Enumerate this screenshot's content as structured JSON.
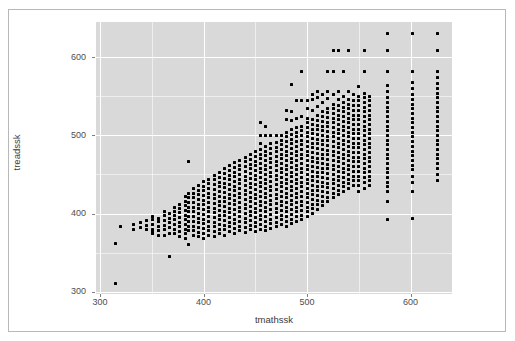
{
  "figure": {
    "kind": "scatterplot",
    "background": "#ffffff",
    "panel_background": "#d9d9d9",
    "grid_color": "#ffffff",
    "point_color": "#000000",
    "axis_text_color": "#4d4d4d",
    "border_color": "#b8b8b8"
  },
  "chart_data": {
    "type": "scatter",
    "title": "",
    "xlabel": "tmathssk",
    "ylabel": "treadssk",
    "xlim": [
      296,
      640
    ],
    "ylim": [
      297,
      645
    ],
    "x_ticks": [
      300,
      400,
      500,
      600
    ],
    "y_ticks": [
      300,
      400,
      500,
      600
    ],
    "x_tick_labels": [
      "300",
      "400",
      "500",
      "600"
    ],
    "y_tick_labels": [
      "300",
      "400",
      "500",
      "600"
    ],
    "grid": "major and minor white gridlines",
    "legend": "none",
    "n_points_approx": 5700,
    "relationship": "strong positive association; discrete scaled-score columns",
    "columns": [
      {
        "x": 315,
        "y": [
          311,
          362
        ]
      },
      {
        "x": 320,
        "y": [
          384
        ]
      },
      {
        "x": 332,
        "y": [
          380,
          386
        ]
      },
      {
        "x": 339,
        "y": [
          382,
          388
        ]
      },
      {
        "x": 345,
        "y": [
          379,
          385,
          391
        ]
      },
      {
        "x": 351,
        "y": [
          374,
          377,
          380,
          386,
          392,
          396
        ]
      },
      {
        "x": 356,
        "y": [
          372,
          378,
          384,
          390,
          394
        ]
      },
      {
        "x": 362,
        "y": [
          372,
          379,
          385,
          391,
          397,
          402
        ]
      },
      {
        "x": 367,
        "y": [
          345,
          375,
          382,
          388,
          394,
          400
        ]
      },
      {
        "x": 372,
        "y": [
          374,
          380,
          386,
          392,
          398,
          403,
          408
        ]
      },
      {
        "x": 377,
        "y": [
          371,
          377,
          383,
          389,
          395,
          401,
          406,
          412
        ]
      },
      {
        "x": 382,
        "y": [
          368,
          374,
          380,
          386,
          392,
          398,
          404,
          410,
          416,
          422
        ]
      },
      {
        "x": 385,
        "y": [
          360,
          378,
          384,
          390,
          396,
          402,
          408,
          414,
          420,
          426,
          467
        ]
      },
      {
        "x": 390,
        "y": [
          372,
          378,
          384,
          390,
          396,
          402,
          408,
          414,
          420,
          426,
          432
        ]
      },
      {
        "x": 395,
        "y": [
          370,
          376,
          382,
          388,
          394,
          400,
          406,
          412,
          418,
          424,
          430,
          436
        ]
      },
      {
        "x": 400,
        "y": [
          368,
          375,
          381,
          387,
          393,
          399,
          405,
          411,
          417,
          423,
          429,
          435,
          441
        ]
      },
      {
        "x": 405,
        "y": [
          372,
          378,
          384,
          390,
          396,
          402,
          408,
          414,
          420,
          426,
          432,
          438,
          444
        ]
      },
      {
        "x": 410,
        "y": [
          370,
          377,
          383,
          389,
          395,
          401,
          407,
          413,
          419,
          425,
          431,
          437,
          443,
          449
        ]
      },
      {
        "x": 415,
        "y": [
          374,
          380,
          386,
          392,
          398,
          404,
          410,
          416,
          422,
          428,
          434,
          440,
          446,
          452
        ]
      },
      {
        "x": 420,
        "y": [
          372,
          379,
          385,
          391,
          397,
          403,
          409,
          415,
          421,
          427,
          433,
          439,
          445,
          451,
          457
        ]
      },
      {
        "x": 425,
        "y": [
          377,
          383,
          389,
          395,
          401,
          407,
          413,
          419,
          425,
          431,
          437,
          443,
          449,
          455,
          461
        ]
      },
      {
        "x": 430,
        "y": [
          375,
          381,
          387,
          393,
          399,
          405,
          411,
          417,
          423,
          429,
          435,
          441,
          447,
          453,
          459,
          465
        ]
      },
      {
        "x": 435,
        "y": [
          378,
          384,
          390,
          396,
          402,
          408,
          414,
          420,
          426,
          432,
          438,
          444,
          450,
          456,
          462,
          468
        ]
      },
      {
        "x": 440,
        "y": [
          376,
          382,
          388,
          394,
          400,
          406,
          412,
          418,
          424,
          430,
          436,
          442,
          448,
          454,
          460,
          466,
          472
        ]
      },
      {
        "x": 445,
        "y": [
          379,
          385,
          391,
          397,
          403,
          409,
          415,
          421,
          427,
          433,
          439,
          445,
          451,
          457,
          463,
          469,
          475
        ]
      },
      {
        "x": 450,
        "y": [
          377,
          383,
          389,
          395,
          401,
          407,
          413,
          419,
          425,
          431,
          437,
          443,
          449,
          455,
          461,
          467,
          473,
          479
        ]
      },
      {
        "x": 455,
        "y": [
          380,
          386,
          392,
          398,
          404,
          410,
          416,
          422,
          428,
          434,
          440,
          446,
          452,
          458,
          464,
          470,
          476,
          482,
          490,
          500,
          516
        ]
      },
      {
        "x": 460,
        "y": [
          378,
          384,
          390,
          396,
          402,
          408,
          414,
          420,
          426,
          432,
          438,
          444,
          450,
          456,
          462,
          468,
          474,
          480,
          486,
          500,
          512
        ]
      },
      {
        "x": 465,
        "y": [
          381,
          387,
          393,
          399,
          405,
          411,
          417,
          423,
          429,
          435,
          441,
          447,
          453,
          459,
          465,
          471,
          477,
          483,
          489,
          500
        ]
      },
      {
        "x": 470,
        "y": [
          383,
          389,
          395,
          401,
          407,
          413,
          419,
          425,
          431,
          437,
          443,
          449,
          455,
          461,
          467,
          473,
          479,
          485,
          491,
          500
        ]
      },
      {
        "x": 475,
        "y": [
          386,
          392,
          398,
          404,
          410,
          416,
          422,
          428,
          434,
          440,
          446,
          452,
          458,
          464,
          470,
          476,
          482,
          488,
          494,
          500
        ]
      },
      {
        "x": 480,
        "y": [
          384,
          390,
          396,
          402,
          408,
          414,
          420,
          426,
          432,
          438,
          444,
          450,
          456,
          462,
          468,
          474,
          480,
          486,
          492,
          498,
          504,
          520,
          532
        ]
      },
      {
        "x": 485,
        "y": [
          387,
          393,
          399,
          405,
          411,
          417,
          423,
          429,
          435,
          441,
          447,
          453,
          459,
          465,
          471,
          477,
          483,
          489,
          495,
          501,
          507,
          519,
          530,
          565
        ]
      },
      {
        "x": 490,
        "y": [
          390,
          396,
          402,
          408,
          414,
          420,
          426,
          432,
          438,
          444,
          450,
          456,
          462,
          468,
          474,
          480,
          486,
          492,
          498,
          504,
          510,
          522,
          545
        ]
      },
      {
        "x": 495,
        "y": [
          392,
          398,
          404,
          410,
          416,
          422,
          428,
          434,
          440,
          446,
          452,
          458,
          464,
          470,
          476,
          482,
          488,
          494,
          500,
          506,
          512,
          524,
          545,
          582
        ]
      },
      {
        "x": 500,
        "y": [
          396,
          402,
          408,
          414,
          420,
          426,
          432,
          438,
          444,
          450,
          456,
          462,
          468,
          474,
          480,
          486,
          492,
          498,
          504,
          510,
          516,
          522,
          534,
          545
        ]
      },
      {
        "x": 505,
        "y": [
          400,
          406,
          412,
          418,
          424,
          430,
          436,
          442,
          448,
          454,
          460,
          466,
          472,
          478,
          484,
          490,
          496,
          502,
          508,
          514,
          520,
          532,
          546,
          552
        ]
      },
      {
        "x": 510,
        "y": [
          405,
          411,
          417,
          423,
          429,
          435,
          441,
          447,
          453,
          459,
          465,
          471,
          477,
          483,
          489,
          495,
          501,
          507,
          513,
          519,
          525,
          537,
          549,
          556
        ]
      },
      {
        "x": 515,
        "y": [
          410,
          416,
          422,
          428,
          434,
          440,
          446,
          452,
          458,
          464,
          470,
          476,
          482,
          488,
          494,
          500,
          506,
          512,
          518,
          524,
          530,
          542,
          552
        ]
      },
      {
        "x": 520,
        "y": [
          415,
          421,
          427,
          433,
          439,
          445,
          451,
          457,
          463,
          469,
          475,
          481,
          487,
          493,
          499,
          505,
          511,
          517,
          523,
          529,
          535,
          547,
          556,
          582
        ]
      },
      {
        "x": 525,
        "y": [
          420,
          426,
          432,
          438,
          444,
          450,
          456,
          462,
          468,
          474,
          480,
          486,
          492,
          498,
          504,
          510,
          516,
          522,
          528,
          534,
          540,
          552,
          582,
          608
        ]
      },
      {
        "x": 530,
        "y": [
          424,
          430,
          436,
          442,
          448,
          454,
          460,
          466,
          472,
          478,
          484,
          490,
          496,
          502,
          508,
          514,
          520,
          526,
          532,
          538,
          546,
          556,
          608
        ]
      },
      {
        "x": 535,
        "y": [
          428,
          434,
          440,
          446,
          452,
          458,
          464,
          470,
          476,
          482,
          488,
          494,
          500,
          506,
          512,
          518,
          524,
          530,
          536,
          542,
          550,
          582
        ]
      },
      {
        "x": 540,
        "y": [
          432,
          438,
          444,
          450,
          456,
          462,
          468,
          474,
          480,
          486,
          492,
          498,
          504,
          510,
          516,
          522,
          528,
          534,
          540,
          546,
          556,
          608
        ]
      },
      {
        "x": 545,
        "y": [
          436,
          442,
          448,
          454,
          460,
          466,
          472,
          478,
          484,
          490,
          496,
          502,
          508,
          514,
          520,
          526,
          532,
          538,
          544,
          552
        ]
      },
      {
        "x": 550,
        "y": [
          428,
          436,
          442,
          448,
          454,
          460,
          466,
          472,
          478,
          484,
          490,
          496,
          502,
          508,
          514,
          520,
          526,
          532,
          538,
          544,
          550,
          562
        ]
      },
      {
        "x": 555,
        "y": [
          432,
          440,
          446,
          452,
          458,
          464,
          470,
          476,
          482,
          488,
          494,
          500,
          506,
          512,
          518,
          524,
          530,
          536,
          542,
          548,
          554,
          582,
          608
        ]
      },
      {
        "x": 560,
        "y": [
          436,
          442,
          448,
          454,
          460,
          466,
          472,
          478,
          484,
          490,
          496,
          502,
          508,
          514,
          520,
          526,
          532,
          538,
          544,
          550
        ]
      },
      {
        "x": 578,
        "y": [
          392,
          415,
          428,
          434,
          440,
          446,
          452,
          458,
          464,
          470,
          476,
          482,
          488,
          494,
          500,
          506,
          512,
          518,
          524,
          530,
          536,
          542,
          548,
          556,
          564,
          582,
          608,
          630
        ]
      },
      {
        "x": 602,
        "y": [
          394,
          428,
          440,
          448,
          456,
          462,
          468,
          474,
          480,
          486,
          492,
          498,
          504,
          510,
          516,
          522,
          528,
          534,
          540,
          546,
          552,
          560,
          568,
          582,
          630
        ]
      },
      {
        "x": 626,
        "y": [
          442,
          450,
          458,
          464,
          470,
          476,
          482,
          488,
          494,
          500,
          506,
          512,
          518,
          524,
          530,
          536,
          542,
          548,
          554,
          560,
          566,
          574,
          582,
          608,
          630
        ]
      }
    ]
  }
}
